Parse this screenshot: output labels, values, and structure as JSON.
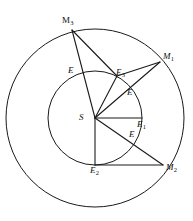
{
  "figure": {
    "stroke_color": "#1a1a1a",
    "background_color": "#ffffff",
    "center": {
      "label": "S",
      "x": 95,
      "y": 118
    },
    "outer_circle": {
      "cx": 95,
      "cy": 118,
      "r": 89
    },
    "inner_circle": {
      "cx": 95,
      "cy": 118,
      "r": 47
    },
    "outer_points": [
      {
        "name": "M1",
        "base": "M",
        "sub": "1",
        "x": 160,
        "y": 62,
        "label_x": 163,
        "label_y": 52
      },
      {
        "name": "M2",
        "base": "M",
        "sub": "2",
        "x": 163,
        "y": 165,
        "label_x": 166,
        "label_y": 163
      },
      {
        "name": "M3",
        "base": "M",
        "sub": "3",
        "x": 72,
        "y": 30,
        "label_x": 62,
        "label_y": 16
      }
    ],
    "inner_points": [
      {
        "name": "E1",
        "base": "E",
        "sub": "1",
        "x": 142,
        "y": 118,
        "label_x": 137,
        "label_y": 120
      },
      {
        "name": "E2",
        "base": "E",
        "sub": "2",
        "x": 95,
        "y": 165,
        "label_x": 90,
        "label_y": 166
      },
      {
        "name": "E3",
        "base": "E",
        "sub": "3",
        "x": 117,
        "y": 76,
        "label_x": 116,
        "label_y": 68
      }
    ],
    "crossing_points": [
      {
        "name": "E-upper-left",
        "base": "E",
        "sub": "",
        "x": 79,
        "y": 73,
        "label_x": 68,
        "label_y": 66
      },
      {
        "name": "E-upper-right",
        "base": "E",
        "sub": "",
        "x": 128,
        "y": 93,
        "label_x": 127,
        "label_y": 88
      },
      {
        "name": "E-lower-right",
        "base": "E",
        "sub": "",
        "x": 131,
        "y": 135,
        "label_x": 129,
        "label_y": 130
      }
    ],
    "segments": [
      {
        "name": "S-to-M1",
        "from": "S",
        "to": "M1"
      },
      {
        "name": "S-to-M2",
        "from": "S",
        "to": "M2"
      },
      {
        "name": "S-to-M3",
        "from": "S",
        "to": "M3"
      },
      {
        "name": "S-to-E1",
        "from": "S",
        "to": "E1"
      },
      {
        "name": "S-to-E2",
        "from": "S",
        "to": "E2"
      },
      {
        "name": "S-to-E3",
        "from": "S",
        "to": "E3"
      },
      {
        "name": "M3-to-E3",
        "from": "M3",
        "to": "E3"
      },
      {
        "name": "E3-to-M1",
        "from": "E3",
        "to": "M1"
      },
      {
        "name": "E2-to-M2",
        "from": "E2",
        "to": "M2"
      }
    ]
  }
}
